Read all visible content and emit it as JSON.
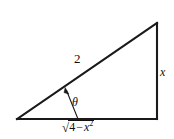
{
  "figure": {
    "type": "right-triangle-trig-diagram",
    "background_color": "#ffffff",
    "stroke_color": "#1a1a1a",
    "vertices": {
      "left": [
        17,
        119
      ],
      "bottom_right": [
        157,
        119
      ],
      "top_right": [
        157,
        23
      ]
    },
    "labels": {
      "hypotenuse": "2",
      "opposite_side": "x",
      "angle": "θ",
      "base_radical_sign": "√",
      "base_radicand_number": "4",
      "base_radicand_operator": "−",
      "base_radicand_variable": "x",
      "base_radicand_exponent": "2",
      "base_full": "√(4 − x²)"
    },
    "angle_marker": {
      "description": "thin curved arrow from the base line up to the hypotenuse indicating theta",
      "arrow_tip": [
        65,
        88
      ],
      "arrow_base": [
        78,
        119
      ]
    }
  }
}
